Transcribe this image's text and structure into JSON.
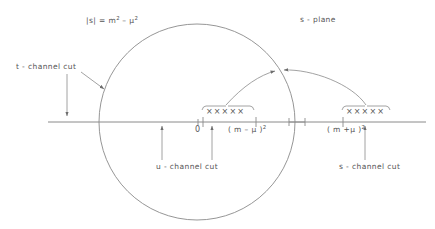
{
  "diagram": {
    "type": "complex-plane-mandelstam",
    "plane_label": "s - plane",
    "circle_label_parts": {
      "prefix": "|s|  =  m",
      "exp1": "2",
      "middle": " – μ",
      "exp2": "2"
    },
    "circle_label_full": "|s| = m² – μ²",
    "annotations": {
      "t_channel": "t - channel cut",
      "u_channel": "u - channel cut",
      "s_channel": "s - channel cut"
    },
    "axis": {
      "origin_label": "0",
      "left_threshold_parts": {
        "body": "( m – μ )",
        "exp": "2"
      },
      "left_threshold_full": "(m – μ)²",
      "right_threshold_parts": {
        "body": "( m +μ )",
        "exp": "2"
      },
      "right_threshold_full": "(m + μ)²"
    },
    "poles": {
      "marker": "×",
      "left_branch_cut_marks": "×××××",
      "right_branch_cut_marks": "×××××",
      "count_per_cut": 5
    },
    "colors": {
      "stroke": "#7a7a7a",
      "text": "#555555",
      "background": "#ffffff"
    }
  }
}
